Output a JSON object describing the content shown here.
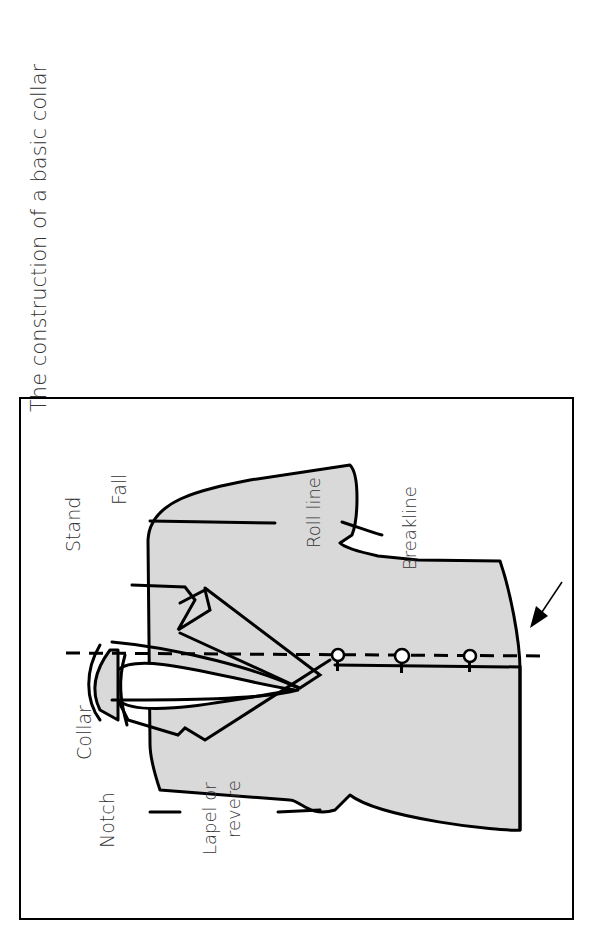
{
  "caption": "The construction of a basic collar",
  "labels": {
    "stand": "Stand",
    "fall": "Fall",
    "roll_line": "Roll line",
    "breakline": "Breakline",
    "collar": "Collar",
    "notch": "Notch",
    "lapel_line1": "Lapel or",
    "lapel_line2": "revere"
  },
  "colors": {
    "garment_fill": "#d9d9d9",
    "outline": "#000000",
    "text": "#333333"
  },
  "buttons_count": 3
}
